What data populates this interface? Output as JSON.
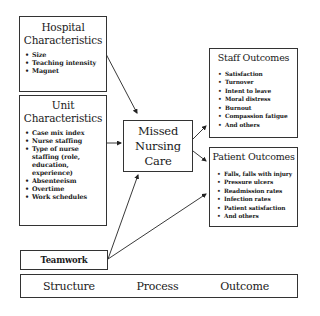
{
  "diagram": {
    "hospital": {
      "title_line1": "Hospital",
      "title_line2": "Characteristics",
      "items": [
        "Size",
        "Teaching intensity",
        "Magnet"
      ]
    },
    "unit": {
      "title_line1": "Unit",
      "title_line2": "Characteristics",
      "items": [
        "Case mix index",
        "Nurse staffing",
        "Type of nurse staffing (role, education, experience)",
        "Absenteeism",
        "Overtime",
        "Work schedules"
      ]
    },
    "missed": {
      "line1": "Missed",
      "line2": "Nursing",
      "line3": "Care"
    },
    "staff": {
      "title": "Staff Outcomes",
      "items": [
        "Satisfaction",
        "Turnover",
        "Intent to leave",
        "Moral distress",
        "Burnout",
        "Compassion fatigue",
        "And others"
      ]
    },
    "patient": {
      "title": "Patient Outcomes",
      "items": [
        "Falls, falls with injury",
        "Pressure ulcers",
        "Readmission rates",
        "Infection rates",
        "Patient satisfaction",
        "And others"
      ]
    },
    "teamwork": {
      "title": "Teamwork"
    },
    "framework": {
      "structure": "Structure",
      "process": "Process",
      "outcome": "Outcome"
    },
    "colors": {
      "line": "#333333",
      "text": "#1a1a1a",
      "background": "#ffffff"
    }
  }
}
